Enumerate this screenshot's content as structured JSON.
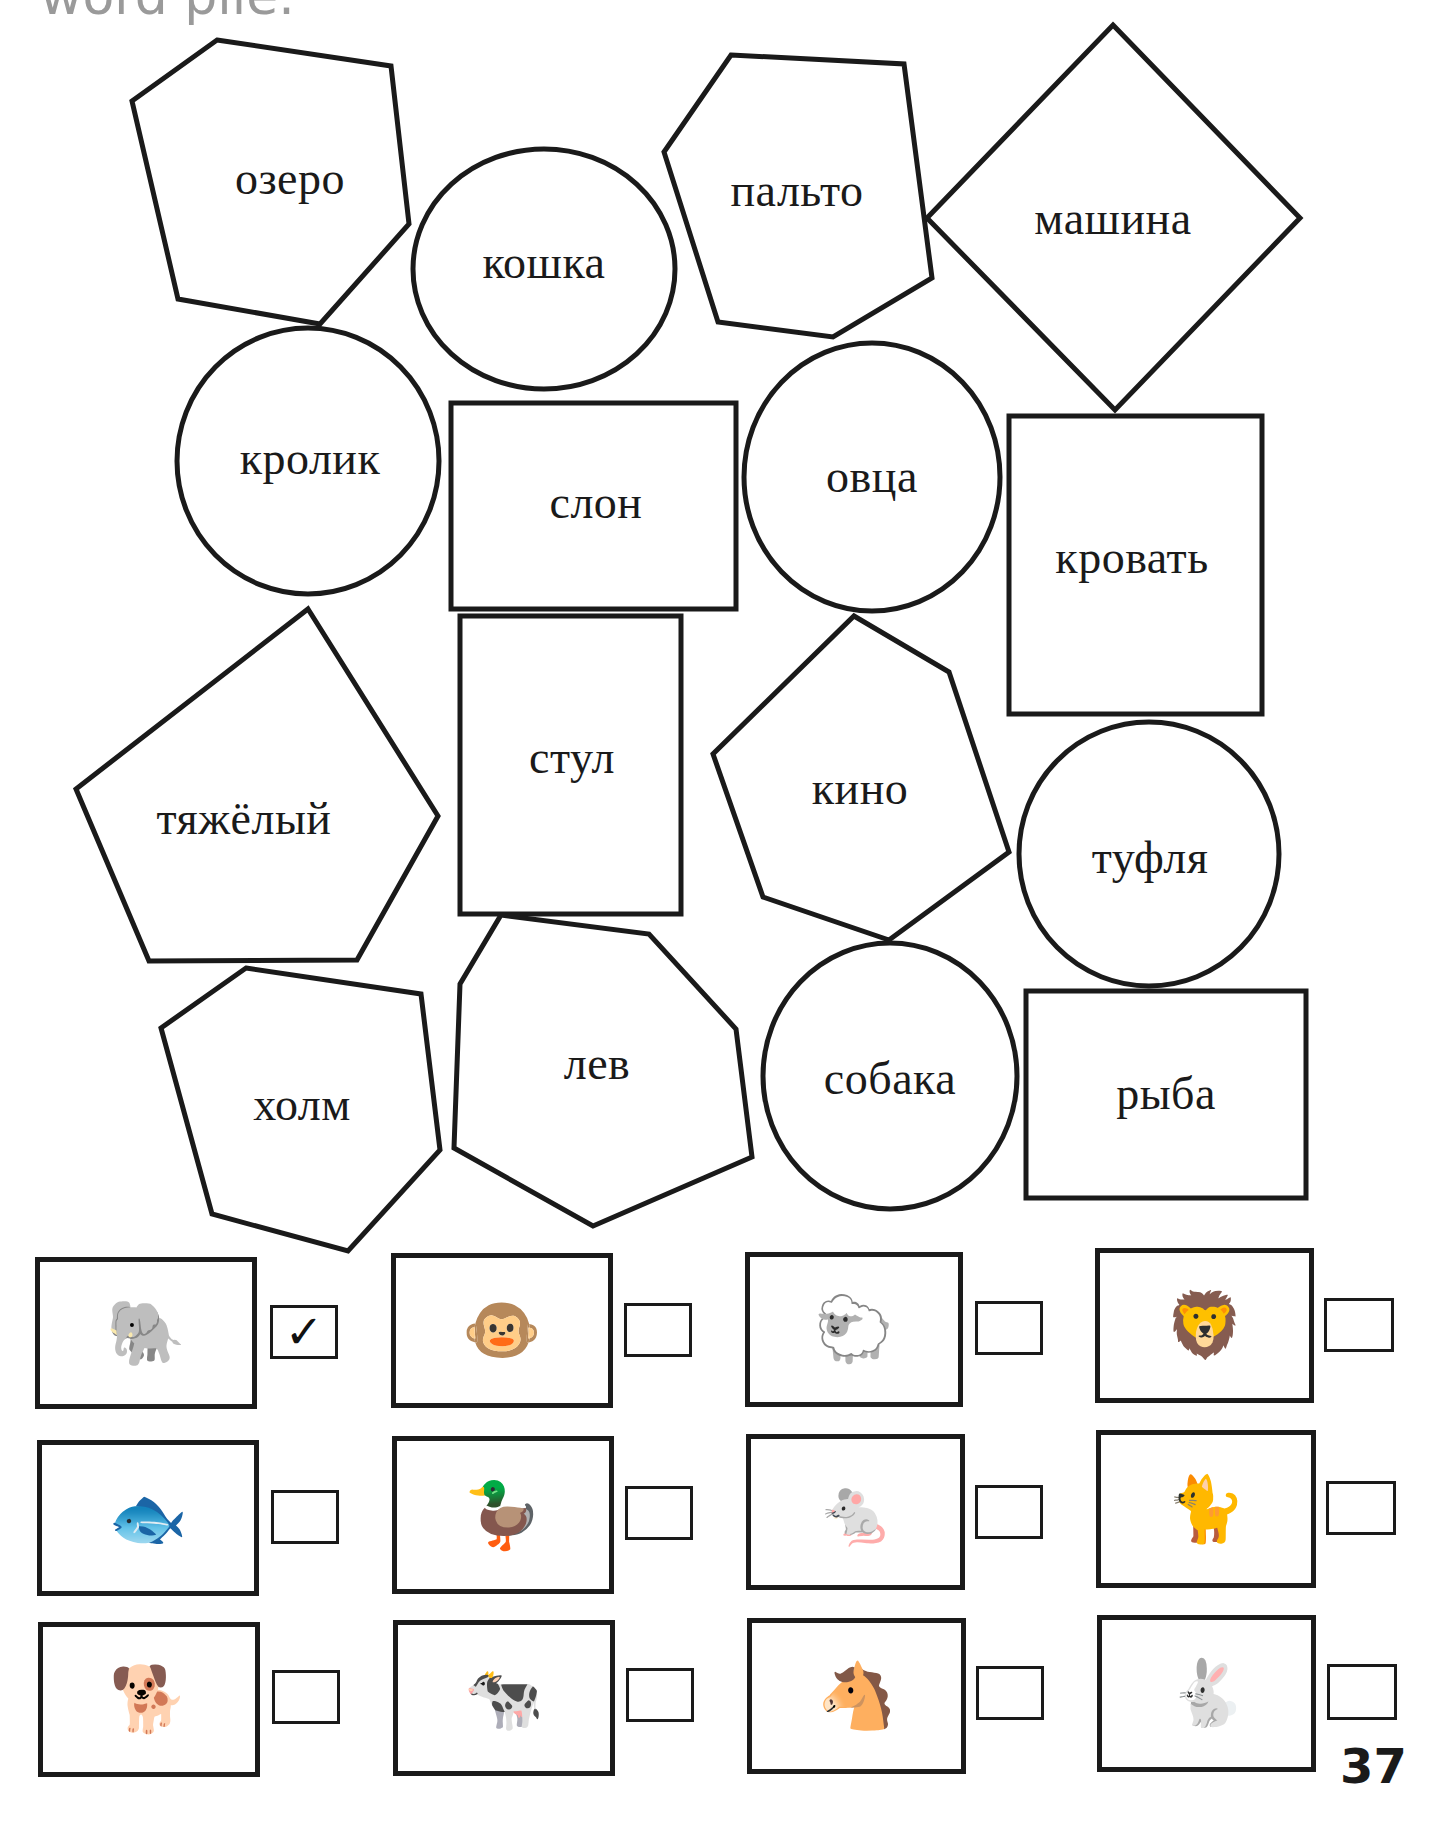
{
  "heading_fragment": "word pile.",
  "words": [
    {
      "id": "ozero",
      "text": "озеро",
      "shape": "hexagon",
      "cx": 290,
      "cy": 178
    },
    {
      "id": "koshka",
      "text": "кошка",
      "shape": "circle",
      "cx": 544,
      "cy": 262
    },
    {
      "id": "palto",
      "text": "пальто",
      "shape": "hexagon",
      "cx": 797,
      "cy": 190
    },
    {
      "id": "mashina",
      "text": "машина",
      "shape": "diamond",
      "cx": 1113,
      "cy": 218
    },
    {
      "id": "krolik",
      "text": "кролик",
      "shape": "circle",
      "cx": 310,
      "cy": 458
    },
    {
      "id": "slon",
      "text": "слон",
      "shape": "rectangle",
      "cx": 596,
      "cy": 502
    },
    {
      "id": "ovtsa",
      "text": "овца",
      "shape": "circle",
      "cx": 872,
      "cy": 476
    },
    {
      "id": "krovat",
      "text": "кровать",
      "shape": "rectangle",
      "cx": 1132,
      "cy": 557
    },
    {
      "id": "tyazhely",
      "text": "тяжёлый",
      "shape": "pentagon",
      "cx": 244,
      "cy": 818
    },
    {
      "id": "stul",
      "text": "стул",
      "shape": "rectangle",
      "cx": 572,
      "cy": 757
    },
    {
      "id": "kino",
      "text": "кино",
      "shape": "hexagon",
      "cx": 860,
      "cy": 788
    },
    {
      "id": "tuflya",
      "text": "туфля",
      "shape": "circle",
      "cx": 1150,
      "cy": 857
    },
    {
      "id": "kholm",
      "text": "холм",
      "shape": "hexagon",
      "cx": 302,
      "cy": 1104
    },
    {
      "id": "lev",
      "text": "лев",
      "shape": "heptagon",
      "cx": 597,
      "cy": 1063
    },
    {
      "id": "sobaka",
      "text": "собака",
      "shape": "circle",
      "cx": 890,
      "cy": 1078
    },
    {
      "id": "ryba",
      "text": "рыба",
      "shape": "rectangle",
      "cx": 1166,
      "cy": 1093
    }
  ],
  "pictures": [
    {
      "animal": "elephant",
      "glyph": "🐘",
      "checked": true,
      "mark": "✓"
    },
    {
      "animal": "monkey",
      "glyph": "🐵",
      "checked": false,
      "mark": ""
    },
    {
      "animal": "sheep",
      "glyph": "🐑",
      "checked": false,
      "mark": ""
    },
    {
      "animal": "lion",
      "glyph": "🦁",
      "checked": false,
      "mark": ""
    },
    {
      "animal": "fish",
      "glyph": "🐟",
      "checked": false,
      "mark": ""
    },
    {
      "animal": "duck",
      "glyph": "🦆",
      "checked": false,
      "mark": ""
    },
    {
      "animal": "mouse",
      "glyph": "🐁",
      "checked": false,
      "mark": ""
    },
    {
      "animal": "cat",
      "glyph": "🐈",
      "checked": false,
      "mark": ""
    },
    {
      "animal": "dog",
      "glyph": "🐕",
      "checked": false,
      "mark": ""
    },
    {
      "animal": "cow",
      "glyph": "🐄",
      "checked": false,
      "mark": ""
    },
    {
      "animal": "horse",
      "glyph": "🐴",
      "checked": false,
      "mark": ""
    },
    {
      "animal": "rabbit",
      "glyph": "🐇",
      "checked": false,
      "mark": ""
    }
  ],
  "page_number": "37"
}
